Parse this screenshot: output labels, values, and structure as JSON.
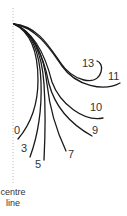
{
  "diagram": {
    "stroke_color": "#1a1a1a",
    "centre_line_color": "#b0b0b0",
    "centre_line_label": [
      "centre",
      "line"
    ],
    "curves": [
      {
        "label": "0",
        "path": "M14,24 C30,32 38,50 38,80 C38,105 30,125 18,139",
        "lx": 14,
        "ly": 134
      },
      {
        "label": "3",
        "path": "M14,24 C32,32 40,52 41,82 C42,110 38,135 30,157",
        "lx": 21,
        "ly": 152
      },
      {
        "label": "5",
        "path": "M14,24 C34,32 42,54 44,84 C46,115 45,140 44,160",
        "lx": 35,
        "ly": 168
      },
      {
        "label": "7",
        "path": "M14,24 C34,32 44,56 47,84 C50,112 58,134 66,151",
        "lx": 68,
        "ly": 158
      },
      {
        "label": "9",
        "path": "M14,24 C34,32 44,58 49,84 C56,110 74,126 92,136",
        "lx": 92,
        "ly": 134
      },
      {
        "label": "10",
        "path": "M14,24 C35,32 46,58 52,82 C60,104 84,122 103,118",
        "lx": 90,
        "ly": 111
      },
      {
        "label": "11",
        "path": "M14,24 C38,28 52,52 62,66 C76,86 104,92 120,83",
        "lx": 108,
        "ly": 80
      },
      {
        "label": "13",
        "path": "M14,24 C38,26 50,48 60,62 C72,80 96,88 101,72 C103,66 100,62 97,61",
        "lx": 82,
        "ly": 67
      }
    ]
  }
}
